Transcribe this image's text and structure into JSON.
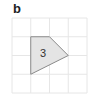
{
  "panel": {
    "label": "b"
  },
  "grid": {
    "origin_px": [
      12,
      18
    ],
    "cell_px": 18.75,
    "cols": 4,
    "rows": 4,
    "line_color": "#e6e6e6"
  },
  "shape": {
    "label": "3",
    "vertices_grid": [
      [
        1,
        1
      ],
      [
        2,
        1
      ],
      [
        3,
        2
      ],
      [
        1,
        3
      ]
    ],
    "fill_color": "#e4e4e4",
    "stroke_color": "#8a8a8a"
  }
}
